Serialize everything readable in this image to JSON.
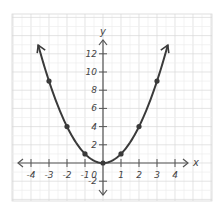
{
  "chart_data": {
    "type": "line",
    "title": "",
    "function": "y = x^2",
    "xlabel": "x",
    "ylabel": "y",
    "xlim": [
      -4.5,
      4.5
    ],
    "ylim": [
      -3,
      14
    ],
    "grid": true,
    "legend": null,
    "x_ticks": [
      -4,
      -3,
      -2,
      -1,
      1,
      2,
      3,
      4
    ],
    "x_tick_labels": [
      "-4",
      "-3",
      "-2",
      "-1",
      "1",
      "2",
      "3",
      "4"
    ],
    "y_ticks": [
      -2,
      2,
      4,
      6,
      8,
      10,
      12
    ],
    "y_tick_labels": [
      "-2",
      "2",
      "4",
      "6",
      "8",
      "10",
      "12"
    ],
    "origin_label": "0",
    "series": [
      {
        "name": "parabola",
        "x": [
          -3,
          -2,
          -1,
          0,
          1,
          2,
          3
        ],
        "y": [
          9,
          4,
          1,
          0,
          1,
          4,
          9
        ],
        "markers": true,
        "arrows_at_ends": true
      }
    ]
  },
  "colors": {
    "curve": "#3a3a3a",
    "axis": "#555555",
    "grid_major": "#d8d8d8",
    "grid_minor": "#eeeeee",
    "background": "#ffffff"
  }
}
